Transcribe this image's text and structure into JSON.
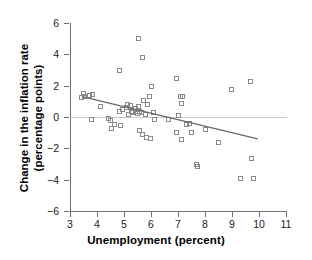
{
  "chart_data": {
    "type": "scatter",
    "title": "",
    "xlabel": "Unemployment (percent)",
    "ylabel_line1": "Change in the inflation rate",
    "ylabel_line2": "(percentage points)",
    "xlim": [
      3,
      11
    ],
    "ylim": [
      -6,
      6
    ],
    "xticks": [
      3,
      4,
      5,
      6,
      7,
      8,
      9,
      10,
      11
    ],
    "xtick_labels": [
      "3",
      "4",
      "5",
      "6",
      "7",
      "8",
      "9",
      "10",
      "11"
    ],
    "yticks": [
      6,
      4,
      2,
      0,
      -2,
      -4,
      -6
    ],
    "ytick_labels": [
      "6",
      "4",
      "2",
      "0",
      "-2",
      "-4",
      "-6"
    ],
    "grid": false,
    "legend": "none",
    "marker": "open-square",
    "marker_color": "#8a8a8a",
    "line_color": "#6a6a6a",
    "zero_line_color": "#c9c9c9",
    "reference_lines": [
      {
        "name": "zero-line",
        "y": 0,
        "style": "thin-solid-light"
      }
    ],
    "trendline": {
      "name": "regression-line",
      "x_start": 3.45,
      "y_start": 1.3,
      "x_end": 9.95,
      "y_end": -1.4,
      "slope": -0.415,
      "intercept": 2.73
    },
    "points": [
      {
        "x": 3.45,
        "y": 1.2
      },
      {
        "x": 3.5,
        "y": 1.45
      },
      {
        "x": 3.55,
        "y": 1.25
      },
      {
        "x": 3.75,
        "y": 1.35
      },
      {
        "x": 3.85,
        "y": 1.4
      },
      {
        "x": 3.8,
        "y": -0.2
      },
      {
        "x": 4.15,
        "y": 0.65
      },
      {
        "x": 4.45,
        "y": -0.15
      },
      {
        "x": 4.5,
        "y": -0.25
      },
      {
        "x": 4.55,
        "y": -0.75
      },
      {
        "x": 4.65,
        "y": -0.5
      },
      {
        "x": 4.85,
        "y": 2.95
      },
      {
        "x": 4.85,
        "y": 0.3
      },
      {
        "x": 4.9,
        "y": -0.55
      },
      {
        "x": 4.95,
        "y": 0.45
      },
      {
        "x": 5.1,
        "y": 0.6
      },
      {
        "x": 5.15,
        "y": 0.75
      },
      {
        "x": 5.2,
        "y": 0.15
      },
      {
        "x": 5.25,
        "y": 0.7
      },
      {
        "x": 5.3,
        "y": 0.3
      },
      {
        "x": 5.35,
        "y": 0.25
      },
      {
        "x": 5.45,
        "y": 0.5
      },
      {
        "x": 5.5,
        "y": 0.35
      },
      {
        "x": 5.5,
        "y": 0.2
      },
      {
        "x": 5.55,
        "y": 4.95
      },
      {
        "x": 5.55,
        "y": 0.65
      },
      {
        "x": 5.6,
        "y": 0.3
      },
      {
        "x": 5.6,
        "y": -0.9
      },
      {
        "x": 5.65,
        "y": 0.25
      },
      {
        "x": 5.7,
        "y": 3.75
      },
      {
        "x": 5.7,
        "y": -1.15
      },
      {
        "x": 5.75,
        "y": 1.05
      },
      {
        "x": 5.8,
        "y": 0.15
      },
      {
        "x": 5.85,
        "y": -1.35
      },
      {
        "x": 5.9,
        "y": 0.75
      },
      {
        "x": 5.95,
        "y": 1.25
      },
      {
        "x": 6.0,
        "y": -1.4
      },
      {
        "x": 6.05,
        "y": 1.9
      },
      {
        "x": 6.1,
        "y": 0.25
      },
      {
        "x": 6.15,
        "y": -0.2
      },
      {
        "x": 6.65,
        "y": -0.2
      },
      {
        "x": 6.95,
        "y": 2.45
      },
      {
        "x": 6.95,
        "y": -1.05
      },
      {
        "x": 7.05,
        "y": 0.05
      },
      {
        "x": 7.1,
        "y": 1.3
      },
      {
        "x": 7.15,
        "y": 0.85
      },
      {
        "x": 7.15,
        "y": -1.45
      },
      {
        "x": 7.2,
        "y": 1.25
      },
      {
        "x": 7.35,
        "y": -0.5
      },
      {
        "x": 7.45,
        "y": -0.45
      },
      {
        "x": 7.5,
        "y": -1.05
      },
      {
        "x": 7.7,
        "y": -3.05
      },
      {
        "x": 7.75,
        "y": -3.2
      },
      {
        "x": 8.05,
        "y": -0.85
      },
      {
        "x": 8.5,
        "y": -1.65
      },
      {
        "x": 9.0,
        "y": 1.75
      },
      {
        "x": 9.35,
        "y": -3.95
      },
      {
        "x": 9.7,
        "y": 2.25
      },
      {
        "x": 9.75,
        "y": -2.65
      },
      {
        "x": 9.8,
        "y": -3.95
      }
    ]
  }
}
